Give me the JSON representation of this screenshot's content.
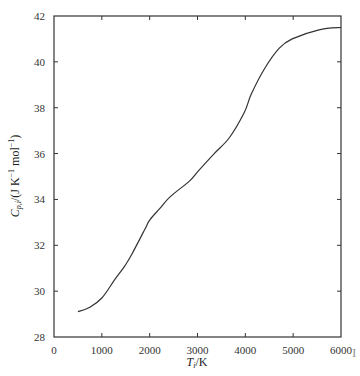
{
  "chart_data": {
    "type": "line",
    "title": "",
    "xlabel": "T_i/K",
    "ylabel": "C_{p,i}/(J K^-1 mol^-1)",
    "xlabel_parts": {
      "main": "T",
      "sub": "i",
      "unit": "/K"
    },
    "ylabel_parts": {
      "main": "C",
      "sub": "p,i",
      "unit_pre": "/(J K",
      "sup1": "−1",
      "mid": " mol",
      "sup2": "−1",
      "close": ")"
    },
    "xlim": [
      0,
      6000
    ],
    "ylim": [
      28,
      42
    ],
    "xticks": [
      0,
      1000,
      2000,
      3000,
      4000,
      5000,
      6000
    ],
    "yticks": [
      28,
      30,
      32,
      34,
      36,
      38,
      40,
      42
    ],
    "grid": false,
    "legend": null,
    "series": [
      {
        "name": "Cp",
        "x": [
          500,
          750,
          1000,
          1270,
          1480,
          1625,
          1900,
          2000,
          2210,
          2420,
          2830,
          3000,
          3350,
          3670,
          3980,
          4125,
          4400,
          4710,
          4980,
          5540,
          6000
        ],
        "values": [
          29.1,
          29.3,
          29.7,
          30.5,
          31.1,
          31.6,
          32.7,
          33.1,
          33.6,
          34.1,
          34.8,
          35.2,
          36.0,
          36.7,
          37.8,
          38.6,
          39.7,
          40.6,
          41.0,
          41.4,
          41.5
        ]
      }
    ],
    "line_color": "#333333"
  },
  "edge_mark": "I"
}
